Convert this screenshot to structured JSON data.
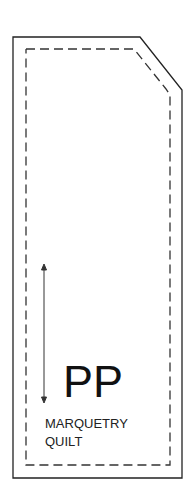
{
  "diagram": {
    "type": "quilt-template-piece",
    "initials": "PP",
    "label_line1": "MARQUETRY",
    "label_line2": "QUILT",
    "outline": "cut-line-solid",
    "seam": "sewing-line-dashed",
    "grain_arrow": "double-headed-vertical",
    "colors": {
      "line": "#222222",
      "background": "#ffffff"
    }
  }
}
